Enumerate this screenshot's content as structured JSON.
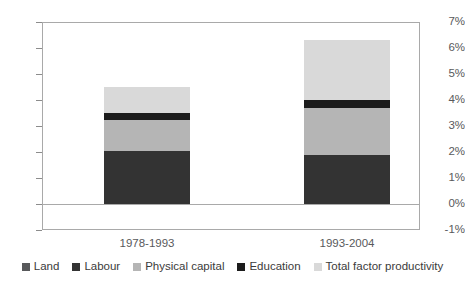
{
  "chart_data": {
    "type": "bar",
    "subtype": "stacked-bar",
    "title": "",
    "subtitle": "",
    "xlabel": "",
    "ylabel": "",
    "categories": [
      "1978-1993",
      "1993-2004"
    ],
    "ylim": [
      -1,
      7
    ],
    "ytick_labels": [
      "7%",
      "6%",
      "5%",
      "4%",
      "3%",
      "2%",
      "1%",
      "0%",
      "-1%"
    ],
    "ytick_values": [
      7,
      6,
      5,
      4,
      3,
      2,
      1,
      0,
      -1
    ],
    "yunit": "%",
    "grid": false,
    "legend_position": "bottom",
    "series": [
      {
        "name": "Land",
        "values": [
          0,
          0
        ],
        "color": "#58595b"
      },
      {
        "name": "Labour",
        "values": [
          2.05,
          1.9
        ],
        "color": "#333333"
      },
      {
        "name": "Physical capital",
        "values": [
          1.2,
          1.8
        ],
        "color": "#b5b5b5"
      },
      {
        "name": "Education",
        "values": [
          0.25,
          0.3
        ],
        "color": "#1c1c1c"
      },
      {
        "name": "Total factor productivity",
        "values": [
          1.0,
          2.3
        ],
        "color": "#d9d9d9"
      }
    ],
    "totals": [
      4.5,
      6.3
    ]
  },
  "legend": {
    "items": [
      {
        "label": "Land",
        "color": "#58595b"
      },
      {
        "label": "Labour",
        "color": "#333333"
      },
      {
        "label": "Physical capital",
        "color": "#b5b5b5"
      },
      {
        "label": "Education",
        "color": "#1c1c1c"
      },
      {
        "label": "Total factor productivity",
        "color": "#d9d9d9"
      }
    ]
  },
  "axes": {
    "frame_color": "#a9a9a9",
    "tick_color": "#8c8c8c",
    "label_color": "#58595b"
  }
}
